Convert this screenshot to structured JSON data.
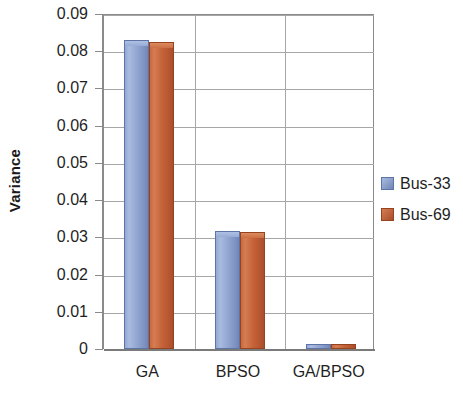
{
  "chart_data": {
    "type": "bar",
    "title": "",
    "subtitle": "",
    "xlabel": "",
    "ylabel": "Variance",
    "categories": [
      "GA",
      "BPSO",
      "GA/BPSO"
    ],
    "series": [
      {
        "name": "Bus-33",
        "color": "#8098C8",
        "values": [
          0.083,
          0.0316,
          0.0013
        ]
      },
      {
        "name": "Bus-69",
        "color": "#C1623C",
        "values": [
          0.0825,
          0.0314,
          0.0013
        ]
      }
    ],
    "ylim": [
      0,
      0.09
    ],
    "ytick_values": [
      0,
      0.01,
      0.02,
      0.03,
      0.04,
      0.05,
      0.06,
      0.07,
      0.08,
      0.09
    ],
    "ytick_labels": [
      "0",
      "0.01",
      "0.02",
      "0.03",
      "0.04",
      "0.05",
      "0.06",
      "0.07",
      "0.08",
      "0.09"
    ],
    "grid": "horizontal-and-category-dividers",
    "legend_position": "right",
    "legend_entries": [
      "Bus-33",
      "Bus-69"
    ],
    "annotations": []
  },
  "colors": {
    "series_blue": "#8098C8",
    "series_orange": "#C1623C",
    "gridline": "#A6A6A6",
    "axis": "#8A8A8A",
    "text": "#1F1F1F",
    "background": "#FFFFFF"
  }
}
